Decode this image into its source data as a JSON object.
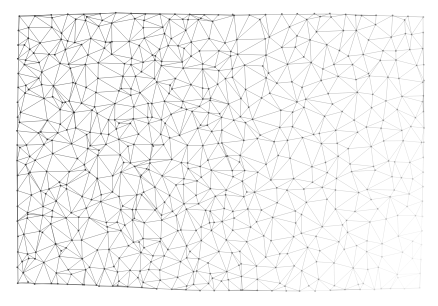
{
  "figure": {
    "kind": "delaunay-triangulation-mesh",
    "title": "",
    "caption": "",
    "background_color": "#ffffff",
    "width": 438,
    "height": 306
  },
  "chart_data": {
    "type": "scatter",
    "title": "",
    "subtitle": "",
    "xlabel": "",
    "ylabel": "",
    "grid": false,
    "legend": null,
    "annotations": [],
    "render_style": "triangulated-mesh-wireframe",
    "description": "Irregular Delaunay triangulation filling a quadrilateral domain; edges drawn as thin gray strokes with small dark vertex dots. Edge opacity falls off toward the right and lower-right of the domain.",
    "domain_polygon": [
      [
        19,
        16
      ],
      [
        116,
        13
      ],
      [
        233,
        15
      ],
      [
        330,
        14
      ],
      [
        423,
        17
      ],
      [
        424,
        128
      ],
      [
        422,
        216
      ],
      [
        420,
        288
      ],
      [
        300,
        291
      ],
      [
        186,
        290
      ],
      [
        84,
        285
      ],
      [
        18,
        283
      ],
      [
        17,
        160
      ],
      [
        18,
        88
      ]
    ],
    "xlim": [
      17,
      424
    ],
    "ylim": [
      13,
      291
    ],
    "vertex_count_approx": 520,
    "edge_color": "#5a5a5a",
    "vertex_color": "#2e2e2e",
    "edge_width_px": 0.5,
    "vertex_radius_px": 0.9,
    "opacity_field": {
      "model": "linear-falloff",
      "max_opacity": 0.85,
      "min_opacity": 0.05,
      "dense_corner": [
        17,
        13
      ],
      "faded_corner": [
        424,
        291
      ],
      "note": "Opacity decreases with normalized distance along x primarily and y secondarily."
    },
    "point_distribution": {
      "model": "jittered-grid-poisson",
      "seed": 20240517,
      "cols": 26,
      "rows": 18,
      "jitter": 0.46
    }
  }
}
